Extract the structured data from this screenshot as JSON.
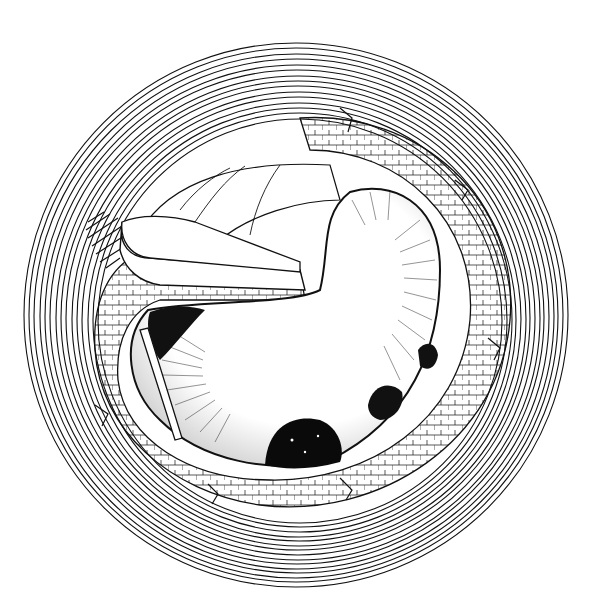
{
  "illustration": {
    "subject": "pen-and-ink drawing of a round well / pit with concentric outer rings, a winding ledge path spiraling inward, and a dark cavern floor",
    "style": "black ink line art on white",
    "colors": {
      "background": "#ffffff",
      "ink": "#111111"
    },
    "outer_ring": {
      "center": [
        296,
        315
      ],
      "rings": 16,
      "outer_radius": 272,
      "inner_radius": 200
    },
    "features": [
      "concentric-ring-wall",
      "spiral-ledge-path",
      "protruding-ledge-tongue",
      "hatched-shadow-patch",
      "dark-pit-opening",
      "radial-hatched-floor",
      "rock-clumps"
    ]
  }
}
